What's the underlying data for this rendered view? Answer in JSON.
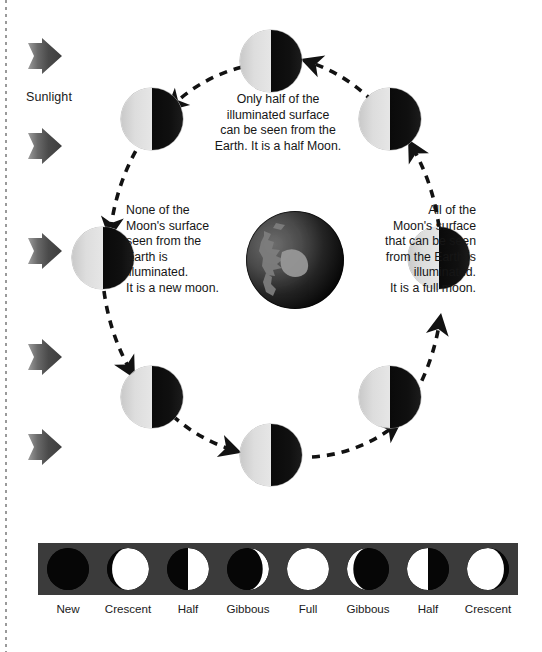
{
  "diagram": {
    "sunlight_label": "Sunlight",
    "sun_arrow_count": 5,
    "captions": {
      "top": "Only half of the illuminated surface can be seen from the Earth. It is a half Moon.",
      "left": "None of the Moon's surface seen from the Earth is illuminated. It is a new moon.",
      "right": "All of the Moon's surface that can be seen from the Earth is illuminated. It is a full moon."
    },
    "caption_lines": {
      "top": [
        "Only half of the",
        "illuminated surface",
        "can be seen from the",
        "Earth. It is a half Moon."
      ],
      "left": [
        "None of the",
        "Moon's surface",
        "seen from the",
        "Earth is",
        "illuminated.",
        "It is a new moon."
      ],
      "right": [
        "All of the",
        "Moon's surface",
        "that can be seen",
        "from the Earth is",
        "illuminated.",
        "It is a full moon."
      ]
    },
    "center_body": "Earth",
    "orbit_moon_count": 8,
    "orbit_direction": "counterclockwise",
    "orbit_moon_appearance": "left half illuminated, right half dark"
  },
  "phase_strip": {
    "labels": [
      "New",
      "Crescent",
      "Half",
      "Gibbous",
      "Full",
      "Gibbous",
      "Half",
      "Crescent"
    ],
    "phases": [
      {
        "name": "New",
        "illuminated_fraction": 0.0,
        "lit_side": "none"
      },
      {
        "name": "Crescent",
        "illuminated_fraction": 0.12,
        "lit_side": "right"
      },
      {
        "name": "Half",
        "illuminated_fraction": 0.5,
        "lit_side": "right"
      },
      {
        "name": "Gibbous",
        "illuminated_fraction": 0.85,
        "lit_side": "right"
      },
      {
        "name": "Full",
        "illuminated_fraction": 1.0,
        "lit_side": "full"
      },
      {
        "name": "Gibbous",
        "illuminated_fraction": 0.85,
        "lit_side": "left"
      },
      {
        "name": "Half",
        "illuminated_fraction": 0.5,
        "lit_side": "left"
      },
      {
        "name": "Crescent",
        "illuminated_fraction": 0.12,
        "lit_side": "left"
      }
    ]
  },
  "colors": {
    "moon_lit": "#dddddd",
    "moon_dark": "#101010",
    "strip_background": "#3b3b3b",
    "phase_lit": "#ffffff",
    "phase_dark": "#060606",
    "arrow": "#4a4a4a",
    "text": "#161616",
    "page_background": "#ffffff",
    "edge_rule": "#9a9a9a"
  }
}
